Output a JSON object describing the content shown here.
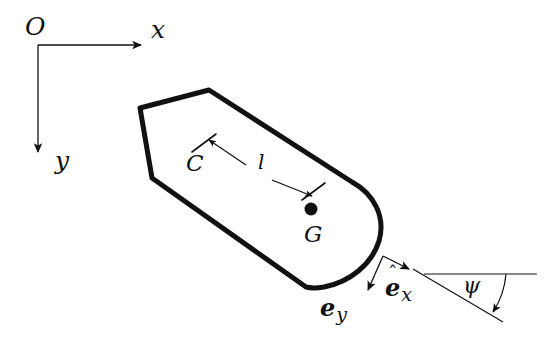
{
  "figure": {
    "kind": "vessel-kinematics-diagram",
    "background_color": "#ffffff",
    "stroke_color": "#111111",
    "hull_stroke_width": 5,
    "thin_stroke_width": 1.2
  },
  "inertial_frame": {
    "origin_label": "O",
    "x_axis_label": "x",
    "y_axis_label": "y",
    "origin_point": [
      38,
      45
    ],
    "x_axis_tip": [
      147,
      45
    ],
    "y_axis_tip": [
      38,
      158
    ]
  },
  "body": {
    "center_label": "C",
    "cg_label": "G",
    "distance_label": "l",
    "cg_point": [
      311,
      209
    ],
    "center_tick_point": [
      205,
      141
    ],
    "cg_tick_point": [
      314,
      192
    ],
    "outline_points": "209,90 140,108 152,178 306,287 333,286 357,276 374,258 380,236 378,214 368,196 352,182",
    "bow_arc": "M352,182 C372,196 386,216 380,240 C374,266 348,285 318,288 C312,288.5 308,288 306,287"
  },
  "body_frame": {
    "origin_point": [
      383,
      256
    ],
    "ex_label_main": "e",
    "ex_label_sub": "x",
    "ex_tip": [
      413,
      271
    ],
    "ey_label_main": "e",
    "ey_label_sub": "y",
    "ey_tip": [
      366,
      295
    ]
  },
  "heading_angle": {
    "label": "ψ",
    "vertex": [
      424,
      274
    ],
    "reference_line_end": [
      537,
      274
    ],
    "body_axis_line_end": [
      503,
      322
    ],
    "arc_radius": 82
  }
}
